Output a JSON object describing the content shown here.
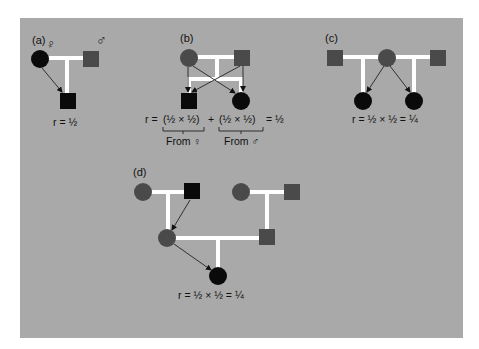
{
  "figure": {
    "colors": {
      "background": "#a9a9a9",
      "affected": "#0a0a0a",
      "unaffected": "#4a4a4a",
      "line": "#ffffff",
      "arrow": "#222222"
    },
    "panels": [
      {
        "id": "a",
        "label": "(a)",
        "description": "Parent-offspring",
        "symbol_annotations": {
          "female": "♀",
          "male": "♂"
        },
        "equation": "r = ½"
      },
      {
        "id": "b",
        "label": "(b)",
        "description": "Full siblings",
        "equation": "r = (½ × ½) + (½ × ½) = ½",
        "term1": "(½ × ½)",
        "term2": "(½ × ½)",
        "prefix": "r =",
        "plus": "+",
        "result": "= ½",
        "brace_labels": [
          "From ♀",
          "From ♂"
        ]
      },
      {
        "id": "c",
        "label": "(c)",
        "description": "Half siblings",
        "equation": "r = ½ × ½ = ¼"
      },
      {
        "id": "d",
        "label": "(d)",
        "description": "Grandparent-grandchild",
        "equation": "r = ½ × ½ = ¼"
      }
    ]
  }
}
